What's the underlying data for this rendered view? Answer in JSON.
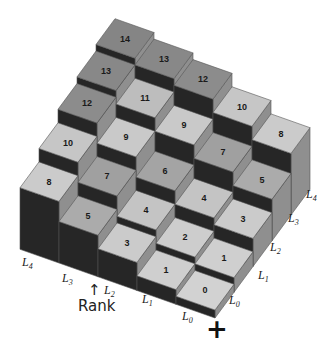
{
  "diagram": {
    "title": "",
    "grid_size": 5,
    "cells": [
      {
        "i": 0,
        "j": 0,
        "value": 0,
        "top_color": "#d2d2d2"
      },
      {
        "i": 1,
        "j": 0,
        "value": 1,
        "top_color": "#cfcfcf"
      },
      {
        "i": 0,
        "j": 1,
        "value": 1,
        "top_color": "#cfcfcf"
      },
      {
        "i": 1,
        "j": 1,
        "value": 2,
        "top_color": "#cdcdcd"
      },
      {
        "i": 2,
        "j": 0,
        "value": 3,
        "top_color": "#cbcbcb"
      },
      {
        "i": 0,
        "j": 2,
        "value": 3,
        "top_color": "#cbcbcb"
      },
      {
        "i": 2,
        "j": 1,
        "value": 4,
        "top_color": "#c4c4c4"
      },
      {
        "i": 1,
        "j": 2,
        "value": 4,
        "top_color": "#c4c4c4"
      },
      {
        "i": 3,
        "j": 0,
        "value": 5,
        "top_color": "#ababab"
      },
      {
        "i": 0,
        "j": 3,
        "value": 5,
        "top_color": "#ababab"
      },
      {
        "i": 2,
        "j": 2,
        "value": 6,
        "top_color": "#a4a4a4"
      },
      {
        "i": 3,
        "j": 1,
        "value": 7,
        "top_color": "#a0a0a0"
      },
      {
        "i": 1,
        "j": 3,
        "value": 7,
        "top_color": "#a0a0a0"
      },
      {
        "i": 4,
        "j": 0,
        "value": 8,
        "top_color": "#cbcbcb"
      },
      {
        "i": 0,
        "j": 4,
        "value": 8,
        "top_color": "#cbcbcb"
      },
      {
        "i": 3,
        "j": 2,
        "value": 9,
        "top_color": "#c9c9c9"
      },
      {
        "i": 2,
        "j": 3,
        "value": 9,
        "top_color": "#c9c9c9"
      },
      {
        "i": 4,
        "j": 1,
        "value": 10,
        "top_color": "#c6c6c6"
      },
      {
        "i": 1,
        "j": 4,
        "value": 10,
        "top_color": "#c6c6c6"
      },
      {
        "i": 3,
        "j": 3,
        "value": 11,
        "top_color": "#bdbdbd"
      },
      {
        "i": 4,
        "j": 2,
        "value": 12,
        "top_color": "#8c8c8c"
      },
      {
        "i": 2,
        "j": 4,
        "value": 12,
        "top_color": "#8c8c8c"
      },
      {
        "i": 4,
        "j": 3,
        "value": 13,
        "top_color": "#888888"
      },
      {
        "i": 3,
        "j": 4,
        "value": 13,
        "top_color": "#888888"
      },
      {
        "i": 4,
        "j": 4,
        "value": 14,
        "top_color": "#858585"
      }
    ],
    "colors": {
      "front_face": "#262626",
      "right_face": "#8f8f8f",
      "edge": "#555555",
      "background": "#ffffff"
    },
    "projection": {
      "origin_x": 215,
      "origin_y": 310,
      "i_dx": -39,
      "i_dy": -13.75,
      "j_dx": 19,
      "j_dy": -25.75,
      "unit_height": 6.7,
      "floor_z": -1.2
    },
    "left_axis_labels": [
      {
        "base": "L",
        "sub": "0",
        "x": 182,
        "y": 320
      },
      {
        "base": "L",
        "sub": "1",
        "x": 142,
        "y": 303
      },
      {
        "base": "L",
        "sub": "2",
        "x": 104,
        "y": 294
      },
      {
        "base": "L",
        "sub": "3",
        "x": 62,
        "y": 282
      },
      {
        "base": "L",
        "sub": "4",
        "x": 22,
        "y": 266
      }
    ],
    "right_axis_labels": [
      {
        "base": "L",
        "sub": "0",
        "x": 229,
        "y": 304
      },
      {
        "base": "L",
        "sub": "1",
        "x": 258,
        "y": 279
      },
      {
        "base": "L",
        "sub": "2",
        "x": 270,
        "y": 251
      },
      {
        "base": "L",
        "sub": "3",
        "x": 288,
        "y": 222
      },
      {
        "base": "L",
        "sub": "4",
        "x": 306,
        "y": 198
      }
    ],
    "rank_label": {
      "arrow": "↑",
      "text": "Rank"
    },
    "plus_symbol": "+"
  }
}
